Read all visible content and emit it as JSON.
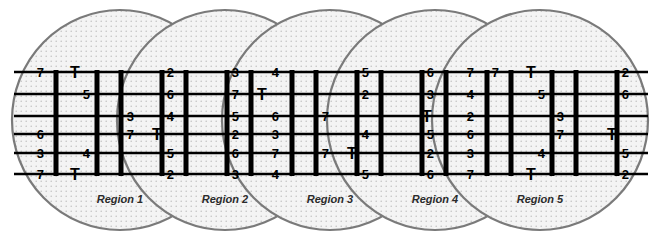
{
  "diagram": {
    "background_color": "#ffffff",
    "ink_color": "#000000",
    "ellipse_stroke_color": "#7a7a7a",
    "ellipse_fill_color": "#f0f0f0",
    "ellipse_dot_color": "#b9b9b9",
    "rail_count": 6,
    "rail_y": [
      72,
      94,
      116,
      134,
      153,
      174
    ],
    "ladder_left": 14,
    "ladder_right": 648,
    "bar_top": 70,
    "bar_bottom": 176
  },
  "regions": [
    {
      "label": "Region 1",
      "cx": 120,
      "cy": 120,
      "rx": 108,
      "ry": 110,
      "label_x": 120,
      "label_y": 203
    },
    {
      "label": "Region 2",
      "cx": 225,
      "cy": 120,
      "rx": 108,
      "ry": 110,
      "label_x": 225,
      "label_y": 203
    },
    {
      "label": "Region 3",
      "cx": 330,
      "cy": 120,
      "rx": 108,
      "ry": 110,
      "label_x": 330,
      "label_y": 203
    },
    {
      "label": "Region 4",
      "cx": 435,
      "cy": 120,
      "rx": 108,
      "ry": 110,
      "label_x": 435,
      "label_y": 203
    },
    {
      "label": "Region 5",
      "cx": 540,
      "cy": 120,
      "rx": 108,
      "ry": 110,
      "label_x": 540,
      "label_y": 203
    }
  ],
  "bars": [
    {
      "x": 56
    },
    {
      "x": 97
    },
    {
      "x": 121
    },
    {
      "x": 162
    },
    {
      "x": 186
    },
    {
      "x": 227
    },
    {
      "x": 251
    },
    {
      "x": 292
    },
    {
      "x": 316
    },
    {
      "x": 357
    },
    {
      "x": 381
    },
    {
      "x": 422
    },
    {
      "x": 446
    },
    {
      "x": 487
    },
    {
      "x": 511
    },
    {
      "x": 552
    },
    {
      "x": 576
    },
    {
      "x": 617
    }
  ],
  "cells": [
    {
      "text": "7",
      "type": "num",
      "x": 44,
      "y": 72,
      "anchor": "end"
    },
    {
      "text": "T",
      "type": "T",
      "x": 75,
      "y": 72,
      "anchor": "middle"
    },
    {
      "text": "5",
      "type": "num",
      "x": 90,
      "y": 94,
      "anchor": "end"
    },
    {
      "text": "6",
      "type": "num",
      "x": 44,
      "y": 134,
      "anchor": "end"
    },
    {
      "text": "3",
      "type": "num",
      "x": 44,
      "y": 153,
      "anchor": "end"
    },
    {
      "text": "4",
      "type": "num",
      "x": 90,
      "y": 153,
      "anchor": "end"
    },
    {
      "text": "7",
      "type": "num",
      "x": 44,
      "y": 174,
      "anchor": "end"
    },
    {
      "text": "T",
      "type": "T",
      "x": 75,
      "y": 174,
      "anchor": "middle"
    },
    {
      "text": "2",
      "type": "num",
      "x": 174,
      "y": 72,
      "anchor": "end"
    },
    {
      "text": "6",
      "type": "num",
      "x": 174,
      "y": 94,
      "anchor": "end"
    },
    {
      "text": "3",
      "type": "num",
      "x": 134,
      "y": 116,
      "anchor": "end"
    },
    {
      "text": "4",
      "type": "num",
      "x": 174,
      "y": 116,
      "anchor": "end"
    },
    {
      "text": "7",
      "type": "num",
      "x": 134,
      "y": 134,
      "anchor": "end"
    },
    {
      "text": "T",
      "type": "T",
      "x": 157,
      "y": 134,
      "anchor": "middle"
    },
    {
      "text": "5",
      "type": "num",
      "x": 174,
      "y": 153,
      "anchor": "end"
    },
    {
      "text": "2",
      "type": "num",
      "x": 174,
      "y": 174,
      "anchor": "end"
    },
    {
      "text": "3",
      "type": "num",
      "x": 239,
      "y": 72,
      "anchor": "end"
    },
    {
      "text": "4",
      "type": "num",
      "x": 279,
      "y": 72,
      "anchor": "end"
    },
    {
      "text": "7",
      "type": "num",
      "x": 239,
      "y": 94,
      "anchor": "end"
    },
    {
      "text": "T",
      "type": "T",
      "x": 262,
      "y": 94,
      "anchor": "middle"
    },
    {
      "text": "5",
      "type": "num",
      "x": 239,
      "y": 116,
      "anchor": "end"
    },
    {
      "text": "6",
      "type": "num",
      "x": 279,
      "y": 116,
      "anchor": "end"
    },
    {
      "text": "2",
      "type": "num",
      "x": 239,
      "y": 134,
      "anchor": "end"
    },
    {
      "text": "3",
      "type": "num",
      "x": 279,
      "y": 134,
      "anchor": "end"
    },
    {
      "text": "6",
      "type": "num",
      "x": 239,
      "y": 153,
      "anchor": "end"
    },
    {
      "text": "7",
      "type": "num",
      "x": 279,
      "y": 153,
      "anchor": "end"
    },
    {
      "text": "3",
      "type": "num",
      "x": 239,
      "y": 174,
      "anchor": "end"
    },
    {
      "text": "4",
      "type": "num",
      "x": 279,
      "y": 174,
      "anchor": "end"
    },
    {
      "text": "5",
      "type": "num",
      "x": 369,
      "y": 72,
      "anchor": "end"
    },
    {
      "text": "2",
      "type": "num",
      "x": 369,
      "y": 94,
      "anchor": "end"
    },
    {
      "text": "7",
      "type": "num",
      "x": 329,
      "y": 116,
      "anchor": "end"
    },
    {
      "text": "4",
      "type": "num",
      "x": 369,
      "y": 134,
      "anchor": "end"
    },
    {
      "text": "7",
      "type": "num",
      "x": 329,
      "y": 153,
      "anchor": "end"
    },
    {
      "text": "T",
      "type": "T",
      "x": 352,
      "y": 153,
      "anchor": "middle"
    },
    {
      "text": "5",
      "type": "num",
      "x": 369,
      "y": 174,
      "anchor": "end"
    },
    {
      "text": "6",
      "type": "num",
      "x": 434,
      "y": 72,
      "anchor": "end"
    },
    {
      "text": "7",
      "type": "num",
      "x": 474,
      "y": 72,
      "anchor": "end"
    },
    {
      "text": "3",
      "type": "num",
      "x": 434,
      "y": 94,
      "anchor": "end"
    },
    {
      "text": "4",
      "type": "num",
      "x": 474,
      "y": 94,
      "anchor": "end"
    },
    {
      "text": "T",
      "type": "T",
      "x": 427,
      "y": 116,
      "anchor": "middle"
    },
    {
      "text": "2",
      "type": "num",
      "x": 474,
      "y": 116,
      "anchor": "end"
    },
    {
      "text": "5",
      "type": "num",
      "x": 434,
      "y": 134,
      "anchor": "end"
    },
    {
      "text": "6",
      "type": "num",
      "x": 474,
      "y": 134,
      "anchor": "end"
    },
    {
      "text": "2",
      "type": "num",
      "x": 434,
      "y": 153,
      "anchor": "end"
    },
    {
      "text": "3",
      "type": "num",
      "x": 474,
      "y": 153,
      "anchor": "end"
    },
    {
      "text": "6",
      "type": "num",
      "x": 434,
      "y": 174,
      "anchor": "end"
    },
    {
      "text": "7",
      "type": "num",
      "x": 474,
      "y": 174,
      "anchor": "end"
    },
    {
      "text": "7",
      "type": "num",
      "x": 499,
      "y": 72,
      "anchor": "end"
    },
    {
      "text": "T",
      "type": "T",
      "x": 531,
      "y": 72,
      "anchor": "middle"
    },
    {
      "text": "5",
      "type": "num",
      "x": 545,
      "y": 94,
      "anchor": "end"
    },
    {
      "text": "3",
      "type": "num",
      "x": 564,
      "y": 116,
      "anchor": "end"
    },
    {
      "text": "7",
      "type": "num",
      "x": 564,
      "y": 134,
      "anchor": "end"
    },
    {
      "text": "4",
      "type": "num",
      "x": 545,
      "y": 153,
      "anchor": "end"
    },
    {
      "text": "T",
      "type": "T",
      "x": 531,
      "y": 174,
      "anchor": "middle"
    },
    {
      "text": "2",
      "type": "num",
      "x": 629,
      "y": 72,
      "anchor": "end"
    },
    {
      "text": "6",
      "type": "num",
      "x": 629,
      "y": 94,
      "anchor": "end"
    },
    {
      "text": "T",
      "type": "T",
      "x": 612,
      "y": 134,
      "anchor": "middle"
    },
    {
      "text": "5",
      "type": "num",
      "x": 629,
      "y": 153,
      "anchor": "end"
    },
    {
      "text": "2",
      "type": "num",
      "x": 629,
      "y": 174,
      "anchor": "end"
    }
  ]
}
